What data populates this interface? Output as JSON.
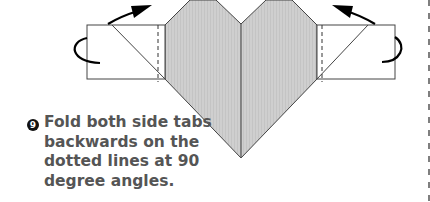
{
  "step": {
    "number": "9",
    "instruction": "Fold both side tabs backwards on the dotted lines at 90 degree angles."
  },
  "colors": {
    "paper_fill": "#cfcfcf",
    "line": "#444444",
    "arrow": "#000000",
    "text": "#555555"
  },
  "icons": [
    "fold-arrow-left-icon",
    "fold-arrow-right-icon",
    "step-number-badge"
  ]
}
